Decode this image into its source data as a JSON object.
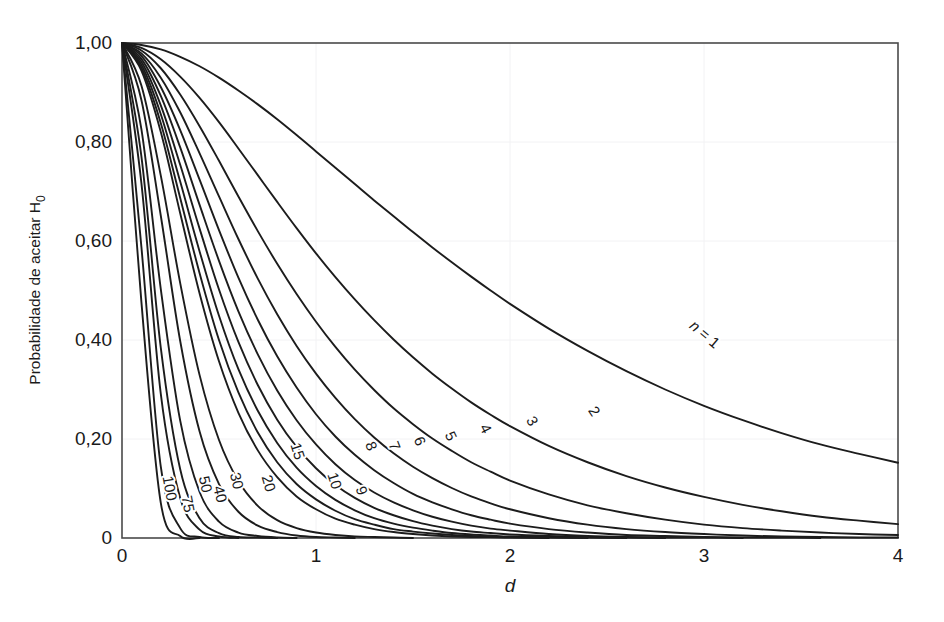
{
  "chart_data": {
    "type": "line",
    "title": "",
    "subtitle": "",
    "xlabel": "d",
    "ylabel": "Probabilidade de aceitar H",
    "ylabel_subscript": "0",
    "xlim": [
      0,
      4
    ],
    "ylim": [
      0,
      1
    ],
    "grid": true,
    "legend_position": "inline-curve-labels",
    "x_ticks": [
      "0",
      "1",
      "2",
      "3",
      "4"
    ],
    "x_tick_values": [
      0,
      1,
      2,
      3,
      4
    ],
    "y_ticks": [
      "0",
      "0,20",
      "0,40",
      "0,60",
      "0,80",
      "1,00"
    ],
    "y_tick_values": [
      0,
      0.2,
      0.4,
      0.6,
      0.8,
      1.0
    ],
    "x_sample": [
      0,
      0.1,
      0.2,
      0.3,
      0.4,
      0.5,
      0.6,
      0.7,
      0.8,
      0.9,
      1.0,
      1.1,
      1.2,
      1.3,
      1.4,
      1.5,
      1.6,
      1.7,
      1.8,
      1.9,
      2.0,
      2.2,
      2.4,
      2.6,
      2.8,
      3.0,
      3.2,
      3.4,
      3.6,
      3.8,
      4.0
    ],
    "series": [
      {
        "name": "n = 1",
        "label": "n = 1",
        "n": 1,
        "label_x": 3.0,
        "label_y": 0.41,
        "label_rotation": 40,
        "values": [
          1.0,
          0.996,
          0.987,
          0.972,
          0.953,
          0.93,
          0.904,
          0.876,
          0.846,
          0.814,
          0.781,
          0.748,
          0.715,
          0.682,
          0.65,
          0.618,
          0.587,
          0.557,
          0.528,
          0.5,
          0.473,
          0.423,
          0.378,
          0.337,
          0.3,
          0.267,
          0.238,
          0.212,
          0.189,
          0.17,
          0.152
        ]
      },
      {
        "name": "2",
        "label": "2",
        "n": 2,
        "label_x": 2.43,
        "label_y": 0.255,
        "label_rotation": 57,
        "values": [
          1.0,
          0.99,
          0.967,
          0.932,
          0.889,
          0.84,
          0.787,
          0.733,
          0.679,
          0.626,
          0.575,
          0.527,
          0.482,
          0.44,
          0.401,
          0.365,
          0.332,
          0.302,
          0.274,
          0.249,
          0.226,
          0.186,
          0.153,
          0.125,
          0.102,
          0.083,
          0.067,
          0.054,
          0.043,
          0.035,
          0.028
        ]
      },
      {
        "name": "3",
        "label": "3",
        "n": 3,
        "label_x": 2.11,
        "label_y": 0.235,
        "label_rotation": 60,
        "values": [
          1.0,
          0.985,
          0.949,
          0.896,
          0.832,
          0.762,
          0.69,
          0.62,
          0.554,
          0.493,
          0.437,
          0.386,
          0.34,
          0.299,
          0.262,
          0.23,
          0.201,
          0.176,
          0.153,
          0.134,
          0.116,
          0.088,
          0.066,
          0.05,
          0.037,
          0.027,
          0.02,
          0.015,
          0.011,
          0.008,
          0.006
        ]
      },
      {
        "name": "4",
        "label": "4",
        "n": 4,
        "label_x": 1.87,
        "label_y": 0.22,
        "label_rotation": 63,
        "values": [
          1.0,
          0.979,
          0.93,
          0.86,
          0.777,
          0.69,
          0.604,
          0.524,
          0.452,
          0.388,
          0.332,
          0.283,
          0.24,
          0.203,
          0.171,
          0.144,
          0.121,
          0.101,
          0.084,
          0.07,
          0.058,
          0.04,
          0.027,
          0.018,
          0.012,
          0.008,
          0.005,
          0.003,
          0.002,
          0.001,
          0.001
        ]
      },
      {
        "name": "5",
        "label": "5",
        "n": 5,
        "label_x": 1.69,
        "label_y": 0.205,
        "label_rotation": 65,
        "values": [
          1.0,
          0.974,
          0.911,
          0.824,
          0.724,
          0.622,
          0.526,
          0.441,
          0.367,
          0.304,
          0.25,
          0.205,
          0.168,
          0.137,
          0.111,
          0.089,
          0.072,
          0.058,
          0.046,
          0.037,
          0.029,
          0.018,
          0.011,
          0.006,
          0.004,
          0.002,
          0.001,
          0.001,
          0.0,
          0.0,
          0.0
        ]
      },
      {
        "name": "6",
        "label": "6",
        "n": 6,
        "label_x": 1.53,
        "label_y": 0.195,
        "label_rotation": 67,
        "values": [
          1.0,
          0.968,
          0.893,
          0.789,
          0.673,
          0.56,
          0.458,
          0.371,
          0.298,
          0.238,
          0.189,
          0.149,
          0.117,
          0.092,
          0.072,
          0.056,
          0.043,
          0.033,
          0.025,
          0.019,
          0.015,
          0.008,
          0.004,
          0.002,
          0.001,
          0.001,
          0.0,
          0.0,
          0.0,
          0.0,
          0.0
        ]
      },
      {
        "name": "7",
        "label": "7",
        "n": 7,
        "label_x": 1.4,
        "label_y": 0.185,
        "label_rotation": 68,
        "values": [
          1.0,
          0.962,
          0.874,
          0.754,
          0.625,
          0.502,
          0.396,
          0.309,
          0.239,
          0.184,
          0.141,
          0.107,
          0.081,
          0.061,
          0.046,
          0.034,
          0.025,
          0.018,
          0.013,
          0.01,
          0.007,
          0.004,
          0.002,
          0.001,
          0.0,
          0.0,
          0.0,
          0.0,
          0.0,
          0.0,
          0.0
        ]
      },
      {
        "name": "8",
        "label": "8",
        "n": 8,
        "label_x": 1.28,
        "label_y": 0.185,
        "label_rotation": 69,
        "values": [
          1.0,
          0.956,
          0.856,
          0.72,
          0.579,
          0.449,
          0.341,
          0.257,
          0.192,
          0.142,
          0.105,
          0.077,
          0.056,
          0.04,
          0.029,
          0.021,
          0.015,
          0.01,
          0.007,
          0.005,
          0.003,
          0.002,
          0.001,
          0.0,
          0.0,
          0.0,
          0.0,
          0.0,
          0.0,
          0.0,
          0.0
        ]
      },
      {
        "name": "9",
        "label": "9",
        "n": 9,
        "label_x": 1.23,
        "label_y": 0.095,
        "label_rotation": 72,
        "values": [
          1.0,
          0.95,
          0.838,
          0.687,
          0.535,
          0.4,
          0.294,
          0.213,
          0.153,
          0.109,
          0.078,
          0.055,
          0.038,
          0.027,
          0.018,
          0.013,
          0.009,
          0.006,
          0.004,
          0.003,
          0.002,
          0.001,
          0.0,
          0.0,
          0.0,
          0.0,
          0.0,
          0.0,
          0.0,
          0.0,
          0.0
        ]
      },
      {
        "name": "10",
        "label": "10",
        "n": 10,
        "label_x": 1.09,
        "label_y": 0.115,
        "label_rotation": 72,
        "values": [
          1.0,
          0.944,
          0.82,
          0.656,
          0.494,
          0.357,
          0.253,
          0.177,
          0.123,
          0.084,
          0.058,
          0.039,
          0.027,
          0.018,
          0.012,
          0.008,
          0.005,
          0.003,
          0.002,
          0.002,
          0.001,
          0.0,
          0.0,
          0.0,
          0.0,
          0.0,
          0.0,
          0.0,
          0.0,
          0.0,
          0.0
        ]
      },
      {
        "name": "15",
        "label": "15",
        "n": 15,
        "label_x": 0.9,
        "label_y": 0.175,
        "label_rotation": 72,
        "values": [
          1.0,
          0.914,
          0.732,
          0.515,
          0.329,
          0.198,
          0.115,
          0.065,
          0.036,
          0.02,
          0.011,
          0.006,
          0.003,
          0.002,
          0.001,
          0.0,
          0.0,
          0.0,
          0.0,
          0.0,
          0.0,
          0.0,
          0.0,
          0.0,
          0.0,
          0.0,
          0.0,
          0.0,
          0.0,
          0.0,
          0.0
        ]
      },
      {
        "name": "20",
        "label": "20",
        "n": 20,
        "label_x": 0.75,
        "label_y": 0.11,
        "label_rotation": 74,
        "values": [
          1.0,
          0.885,
          0.651,
          0.398,
          0.215,
          0.109,
          0.053,
          0.025,
          0.012,
          0.005,
          0.002,
          0.001,
          0.0,
          0.0,
          0.0,
          0.0,
          0.0,
          0.0,
          0.0,
          0.0,
          0.0,
          0.0,
          0.0,
          0.0,
          0.0,
          0.0,
          0.0,
          0.0,
          0.0,
          0.0,
          0.0
        ]
      },
      {
        "name": "30",
        "label": "30",
        "n": 30,
        "label_x": 0.585,
        "label_y": 0.115,
        "label_rotation": 76,
        "values": [
          1.0,
          0.826,
          0.503,
          0.237,
          0.093,
          0.033,
          0.011,
          0.004,
          0.001,
          0.0,
          0.0,
          0.0,
          0.0,
          0.0,
          0.0,
          0.0,
          0.0,
          0.0,
          0.0,
          0.0,
          0.0,
          0.0,
          0.0,
          0.0,
          0.0,
          0.0,
          0.0,
          0.0,
          0.0,
          0.0,
          0.0
        ]
      },
      {
        "name": "40",
        "label": "40",
        "n": 40,
        "label_x": 0.5,
        "label_y": 0.088,
        "label_rotation": 77,
        "values": [
          1.0,
          0.771,
          0.384,
          0.139,
          0.04,
          0.01,
          0.002,
          0.001,
          0.0,
          0.0,
          0.0,
          0.0,
          0.0,
          0.0,
          0.0,
          0.0,
          0.0,
          0.0,
          0.0,
          0.0,
          0.0,
          0.0,
          0.0,
          0.0,
          0.0,
          0.0,
          0.0,
          0.0,
          0.0,
          0.0,
          0.0
        ]
      },
      {
        "name": "50",
        "label": "50",
        "n": 50,
        "label_x": 0.425,
        "label_y": 0.108,
        "label_rotation": 78,
        "values": [
          1.0,
          0.717,
          0.291,
          0.081,
          0.017,
          0.003,
          0.0,
          0.0,
          0.0,
          0.0,
          0.0,
          0.0,
          0.0,
          0.0,
          0.0,
          0.0,
          0.0,
          0.0,
          0.0,
          0.0,
          0.0,
          0.0,
          0.0,
          0.0,
          0.0,
          0.0,
          0.0,
          0.0,
          0.0,
          0.0,
          0.0
        ]
      },
      {
        "name": "75",
        "label": "75",
        "n": 75,
        "label_x": 0.335,
        "label_y": 0.068,
        "label_rotation": 79,
        "values": [
          1.0,
          0.588,
          0.144,
          0.02,
          0.002,
          0.0,
          0.0,
          0.0,
          0.0,
          0.0,
          0.0,
          0.0,
          0.0,
          0.0,
          0.0,
          0.0,
          0.0,
          0.0,
          0.0,
          0.0,
          0.0,
          0.0,
          0.0,
          0.0,
          0.0,
          0.0,
          0.0,
          0.0,
          0.0,
          0.0,
          0.0
        ]
      },
      {
        "name": "100",
        "label": "100",
        "n": 100,
        "label_x": 0.24,
        "label_y": 0.1,
        "label_rotation": 80,
        "values": [
          1.0,
          0.477,
          0.071,
          0.004,
          0.0,
          0.0,
          0.0,
          0.0,
          0.0,
          0.0,
          0.0,
          0.0,
          0.0,
          0.0,
          0.0,
          0.0,
          0.0,
          0.0,
          0.0,
          0.0,
          0.0,
          0.0,
          0.0,
          0.0,
          0.0,
          0.0,
          0.0,
          0.0,
          0.0,
          0.0,
          0.0
        ]
      }
    ]
  },
  "colors": {
    "curve": "#1c1c1c",
    "frame": "#4a4a4a",
    "grid": "#f2f2f4",
    "background": "#ffffff",
    "text": "#1a1a1a"
  }
}
